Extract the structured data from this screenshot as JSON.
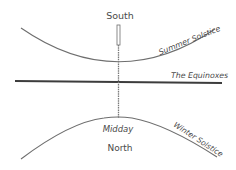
{
  "diagram": {
    "labels": {
      "top": "South",
      "bottom": "North",
      "midday": "Midday",
      "summer": "Summer Solstice",
      "equinox": "The Equinoxes",
      "winter": "Winter Solstice"
    },
    "colors": {
      "line": "#6e6e6e",
      "equinox_line": "#3c3c3c",
      "text": "#4a4a4a"
    }
  }
}
